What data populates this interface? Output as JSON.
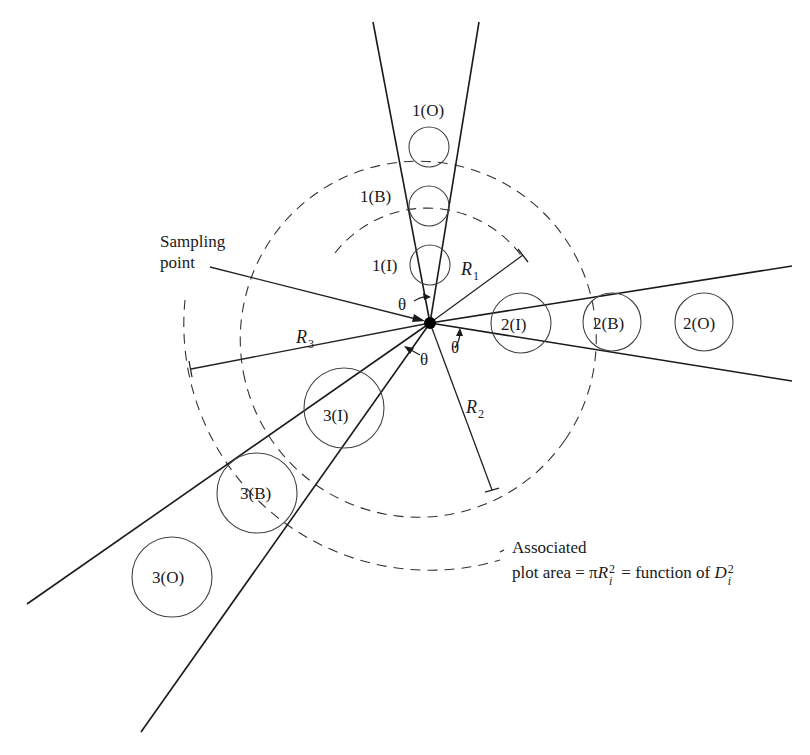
{
  "figure": {
    "type": "diagram",
    "sampling_point_label_line1": "Sampling",
    "sampling_point_label_line2": "point",
    "angle_label": "θ",
    "radii": [
      {
        "name": "R",
        "subscript": "1"
      },
      {
        "name": "R",
        "subscript": "2"
      },
      {
        "name": "R",
        "subscript": "3"
      }
    ],
    "trees": {
      "sector1": [
        {
          "label": "1(O)",
          "status": "Out"
        },
        {
          "label": "1(B)",
          "status": "Borderline"
        },
        {
          "label": "1(I)",
          "status": "In"
        }
      ],
      "sector2": [
        {
          "label": "2(I)",
          "status": "In"
        },
        {
          "label": "2(B)",
          "status": "Borderline"
        },
        {
          "label": "2(O)",
          "status": "Out"
        }
      ],
      "sector3": [
        {
          "label": "3(I)",
          "status": "In"
        },
        {
          "label": "3(B)",
          "status": "Borderline"
        },
        {
          "label": "3(O)",
          "status": "Out"
        }
      ]
    },
    "annotation": {
      "line1": "Associated",
      "line2_prefix": "plot area = π",
      "r_symbol": "R",
      "r_sup": "2",
      "r_sub": "i",
      "line2_middle": " = function of ",
      "d_symbol": "D",
      "d_sup": "2",
      "d_sub": "i"
    }
  }
}
